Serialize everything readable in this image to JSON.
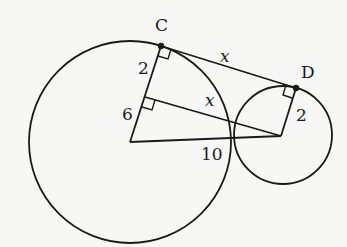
{
  "diagram": {
    "type": "geometry",
    "points": {
      "C": {
        "label": "C"
      },
      "D": {
        "label": "D"
      }
    },
    "labels": {
      "segment_CD": "x",
      "inner_segment": "x",
      "big_radius_top": "2",
      "big_radius_bottom": "6",
      "small_radius": "2",
      "center_distance": "10"
    },
    "colors": {
      "stroke": "#1a1a1a",
      "background": "#f7f7f5"
    }
  }
}
